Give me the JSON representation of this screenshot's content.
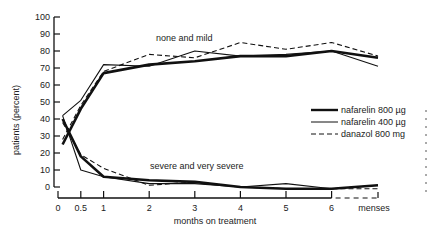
{
  "chart_data": {
    "type": "line",
    "title": "",
    "xlabel": "months on treatment",
    "ylabel": "patients (percent)",
    "ylim": [
      0,
      100
    ],
    "yticks": [
      0,
      10,
      20,
      30,
      40,
      50,
      60,
      70,
      80,
      90,
      100
    ],
    "ytick_labels": [
      "0",
      "10",
      "20",
      "30",
      "40",
      "50",
      "60",
      "70",
      "80",
      "90",
      "100"
    ],
    "xticks": [
      0,
      0.5,
      1,
      2,
      3,
      4,
      5,
      6
    ],
    "xtick_labels": [
      "0",
      "0.5",
      "1",
      "2",
      "3",
      "4",
      "5",
      "6"
    ],
    "x_extra_label": "menses",
    "x": [
      0.1,
      0.5,
      1,
      2,
      3,
      4,
      5,
      6,
      "menses"
    ],
    "grid": false,
    "legend_position": "right",
    "annotations": [
      "none and mild",
      "severe and very severe"
    ],
    "series": [
      {
        "name": "nafarelin 800 µg",
        "style": "thick-solid",
        "group": "none and mild",
        "values": [
          25,
          46,
          67,
          72,
          74,
          77,
          77,
          80,
          76
        ]
      },
      {
        "name": "nafarelin 400 µg",
        "style": "thin-solid",
        "group": "none and mild",
        "values": [
          42,
          51,
          72,
          71,
          80,
          77,
          78,
          80,
          71
        ]
      },
      {
        "name": "danazol 800 mg",
        "style": "dashed",
        "group": "none and mild",
        "values": [
          28,
          48,
          68,
          78,
          76,
          85,
          81,
          85,
          77
        ]
      },
      {
        "name": "nafarelin 800 µg",
        "style": "thick-solid",
        "group": "severe and very severe",
        "values": [
          40,
          18,
          6,
          4,
          3,
          0,
          -1,
          -1,
          1
        ]
      },
      {
        "name": "nafarelin 400 µg",
        "style": "thin-solid",
        "group": "severe and very severe",
        "values": [
          42,
          10,
          6,
          2,
          2,
          0,
          2,
          -1,
          1
        ]
      },
      {
        "name": "danazol 800 mg",
        "style": "dashed",
        "group": "severe and very severe",
        "values": [
          38,
          19,
          11,
          1,
          3,
          0,
          -1,
          -1,
          -1
        ]
      }
    ],
    "legend": [
      {
        "label": "nafarelin 800 µg",
        "style": "thick-solid"
      },
      {
        "label": "nafarelin 400 µg",
        "style": "thin-solid"
      },
      {
        "label": "danazol 800 mg",
        "style": "dashed"
      }
    ]
  }
}
